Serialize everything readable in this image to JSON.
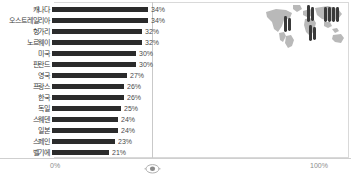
{
  "chart_data": {
    "type": "bar",
    "orientation": "horizontal",
    "title": "",
    "xlabel": "",
    "ylabel": "",
    "xlim": [
      0,
      100
    ],
    "grid": true,
    "gridlines": [
      "50%"
    ],
    "legend": "none",
    "categories": [
      "캐나다",
      "오스트레일리아",
      "헝가리",
      "노르웨이",
      "미국",
      "핀란드",
      "영국",
      "프랑스",
      "한국",
      "독일",
      "스웨덴",
      "일본",
      "스페인",
      "벨기에"
    ],
    "values": [
      34,
      34,
      32,
      32,
      30,
      30,
      27,
      26,
      26,
      25,
      24,
      24,
      23,
      21
    ],
    "value_labels": [
      "34%",
      "34%",
      "32%",
      "32%",
      "30%",
      "30%",
      "27%",
      "26%",
      "26%",
      "25%",
      "24%",
      "24%",
      "23%",
      "21%"
    ],
    "bar_pixel_lengths": [
      96,
      96,
      90,
      90,
      84,
      84,
      75,
      72,
      72,
      69,
      66,
      66,
      63,
      57
    ],
    "axis_ticks": [
      "0%",
      "100%"
    ],
    "bar_color": "#2b2b2b",
    "gridline_color": "#c9c9c9",
    "background_color": "#ffffff"
  },
  "axis": {
    "left_tick": "0%",
    "right_tick": "100%"
  },
  "map_inset": {
    "name": "world-map-inset",
    "map_color": "#b4b4b4",
    "marker_color": "#3a3a3a",
    "marker_clusters": 4
  },
  "icons": {
    "axis_marker": "axis-center-marker-icon"
  }
}
